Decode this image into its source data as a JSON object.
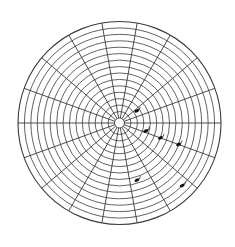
{
  "diagram": {
    "type": "polar-grid",
    "ring_count": 15,
    "spoke_count": 18,
    "spoke_step_degrees": 20,
    "line_color": "#3a3a3a",
    "mark_color": "#111111",
    "marks": [
      {
        "id": "mark-1",
        "angle_deg": 35,
        "ring": 2.5
      },
      {
        "id": "mark-2",
        "angle_deg": -17,
        "ring": 3.5
      },
      {
        "id": "mark-3",
        "angle_deg": -20,
        "ring": 6
      },
      {
        "id": "mark-4",
        "angle_deg": -20,
        "ring": 9
      },
      {
        "id": "mark-5",
        "angle_deg": -73,
        "ring": 8.5
      },
      {
        "id": "mark-6",
        "angle_deg": -45,
        "ring": 13
      }
    ]
  }
}
